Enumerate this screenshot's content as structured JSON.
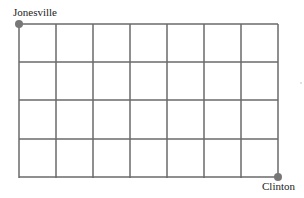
{
  "diagram": {
    "type": "street-grid",
    "columns": 7,
    "rows": 4,
    "start": {
      "label": "Jonesville",
      "corner": "top-left"
    },
    "end": {
      "label": "Clinton",
      "corner": "bottom-right"
    },
    "colors": {
      "grid": "#666666",
      "point": "#777777",
      "text": "#222222"
    }
  }
}
